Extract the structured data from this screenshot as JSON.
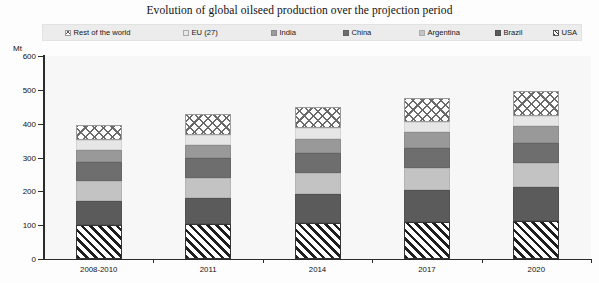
{
  "title": "Evolution of global oilseed production over the projection period",
  "legend": {
    "items": [
      {
        "label": "Rest of the world",
        "key": "row",
        "swatch": "crosshatch-swatch",
        "color": "#ffffff"
      },
      {
        "label": "EU (27)",
        "key": "eu",
        "swatch": "light-grey-swatch",
        "color": "#e6e6e6"
      },
      {
        "label": "India",
        "key": "india",
        "swatch": "mid-grey-swatch",
        "color": "#999999"
      },
      {
        "label": "China",
        "key": "china",
        "swatch": "dark-grey-swatch",
        "color": "#6e6e6e"
      },
      {
        "label": "Argentina",
        "key": "argentina",
        "swatch": "pale-grey-swatch",
        "color": "#c3c3c3"
      },
      {
        "label": "Brazil",
        "key": "brazil",
        "swatch": "darker-grey-swatch",
        "color": "#5b5b5b"
      },
      {
        "label": "USA",
        "key": "usa",
        "swatch": "diagonal-hatch-swatch",
        "color": "#ffffff"
      }
    ]
  },
  "axes": {
    "y_unit": "Mt",
    "y_ticks": [
      "600",
      "500",
      "400",
      "300",
      "200",
      "100",
      "0"
    ],
    "x_ticks": [
      "2008-2010",
      "2011",
      "2014",
      "2017",
      "2020"
    ]
  },
  "chart_data": {
    "type": "bar",
    "stacked": true,
    "title": "Evolution of global oilseed production over the projection period",
    "xlabel": "",
    "ylabel": "Mt",
    "ylim": [
      0,
      600
    ],
    "ytick_step": 100,
    "grid": false,
    "legend_position": "top",
    "categories": [
      "2008-2010",
      "2011",
      "2014",
      "2017",
      "2020"
    ],
    "series": [
      {
        "name": "USA",
        "values": [
          100,
          103,
          106,
          110,
          113
        ]
      },
      {
        "name": "Brazil",
        "values": [
          72,
          77,
          86,
          93,
          100
        ]
      },
      {
        "name": "Argentina",
        "values": [
          58,
          60,
          63,
          66,
          70
        ]
      },
      {
        "name": "China",
        "values": [
          57,
          58,
          59,
          60,
          61
        ]
      },
      {
        "name": "India",
        "values": [
          36,
          39,
          42,
          45,
          48
        ]
      },
      {
        "name": "EU (27)",
        "values": [
          28,
          29,
          30,
          31,
          32
        ]
      },
      {
        "name": "Rest of the world",
        "values": [
          44,
          64,
          64,
          70,
          73
        ]
      }
    ],
    "totals": [
      395,
      430,
      450,
      475,
      497
    ]
  }
}
